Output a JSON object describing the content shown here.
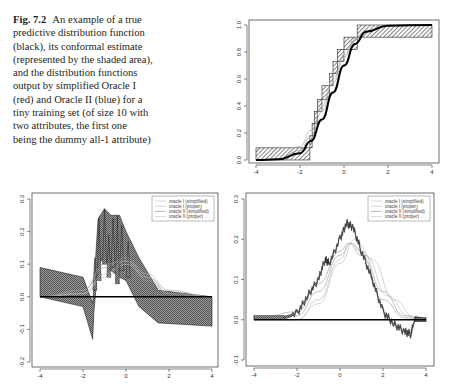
{
  "caption": {
    "label": "Fig. 7.2",
    "text": "An example of a true predictive distribution function (black), its conformal estimate (represented by the shaded area), and the distribution functions output by simplified Oracle I (red) and Oracle II (blue) for a tiny training set (of size 10 with two attributes, the first one being the dummy all-1 attribute)"
  },
  "colors": {
    "true_function": "#000000",
    "shading": "#555555",
    "oracle_curves": "#aaaaaa",
    "frame": "#333333"
  },
  "chart_data": [
    {
      "id": "top-right",
      "type": "line",
      "title": "",
      "xlabel": "",
      "ylabel": "",
      "xlim": [
        -4,
        4
      ],
      "ylim": [
        0,
        1
      ],
      "xticks": [
        "-4",
        "-2",
        "0",
        "2",
        "4"
      ],
      "yticks": [
        "0.0",
        "0.2",
        "0.4",
        "0.6",
        "0.8",
        "1.0"
      ],
      "grid": false,
      "series": [
        {
          "name": "true predictive distribution (black)",
          "x": [
            -4,
            -3,
            -2,
            -1.5,
            -1,
            -0.5,
            0,
            0.5,
            1,
            2,
            4
          ],
          "values": [
            0.0,
            0.005,
            0.05,
            0.14,
            0.3,
            0.5,
            0.7,
            0.86,
            0.95,
            0.995,
            1.0
          ]
        },
        {
          "name": "conformal estimate (shaded steps)",
          "x": [
            -4,
            -1.55,
            -1.45,
            -1.35,
            -1.2,
            -1.0,
            -0.65,
            -0.5,
            -0.3,
            0.0,
            0.6,
            4
          ],
          "lower": [
            0,
            0.09,
            0.18,
            0.27,
            0.36,
            0.45,
            0.55,
            0.64,
            0.73,
            0.82,
            0.91,
            0.91
          ],
          "upper": [
            0.09,
            0.18,
            0.27,
            0.36,
            0.45,
            0.55,
            0.64,
            0.73,
            0.82,
            0.91,
            1.0,
            1.0
          ]
        },
        {
          "name": "oracle I (simplified)"
        },
        {
          "name": "oracle II (simplified)"
        }
      ]
    },
    {
      "id": "bottom-left",
      "type": "line",
      "title": "",
      "xlim": [
        -4,
        4
      ],
      "ylim": [
        -0.2,
        0.3
      ],
      "xticks": [
        "-4",
        "-2",
        "0",
        "2",
        "4"
      ],
      "yticks": [
        "-0.2",
        "-0.1",
        "0.0",
        "0.1",
        "0.2",
        "0.3"
      ],
      "grid": false,
      "legend": {
        "position": "topright",
        "entries": [
          "oracle I (simplified)",
          "oracle I (proper)",
          "oracle II (simplified)",
          "oracle II (proper)"
        ]
      },
      "series": [
        {
          "name": "zero reference line",
          "x": [
            -4,
            4
          ],
          "values": [
            0,
            0
          ]
        },
        {
          "name": "conformal difference band (shaded)",
          "x": [
            -4,
            -2,
            -1.55,
            -1.5,
            -1.3,
            -1.0,
            -0.7,
            -0.3,
            0,
            0.6,
            1.5,
            4
          ],
          "upper": [
            0.09,
            0.06,
            -0.02,
            0.03,
            0.24,
            0.27,
            0.25,
            0.25,
            0.2,
            0.12,
            0.02,
            0.0
          ],
          "lower": [
            0.0,
            -0.03,
            -0.13,
            -0.05,
            0.1,
            0.12,
            0.08,
            0.06,
            0.05,
            -0.03,
            -0.08,
            -0.09
          ]
        },
        {
          "name": "oracle I (simplified)",
          "x": [
            -4,
            -2,
            -1,
            0,
            1,
            2,
            4
          ],
          "values": [
            0,
            0.02,
            0.09,
            0.12,
            0.06,
            0.01,
            0
          ]
        },
        {
          "name": "oracle I (proper)",
          "x": [
            -4,
            -2,
            -1,
            0,
            1,
            2,
            4
          ],
          "values": [
            0,
            0.01,
            0.07,
            0.11,
            0.07,
            0.02,
            0
          ]
        },
        {
          "name": "oracle II (simplified)",
          "x": [
            -4,
            -2,
            -1,
            0,
            1,
            2,
            4
          ],
          "values": [
            0,
            0.02,
            0.1,
            0.11,
            0.05,
            0.01,
            0
          ]
        },
        {
          "name": "oracle II (proper)",
          "x": [
            -4,
            -2,
            -1,
            0,
            1,
            2,
            4
          ],
          "values": [
            0,
            0.01,
            0.06,
            0.1,
            0.06,
            0.02,
            0
          ]
        }
      ]
    },
    {
      "id": "bottom-right",
      "type": "line",
      "title": "",
      "xlim": [
        -4,
        4
      ],
      "ylim": [
        -0.1,
        0.3
      ],
      "xticks": [
        "-4",
        "-2",
        "0",
        "2",
        "4"
      ],
      "yticks": [
        "-0.1",
        "0.0",
        "0.1",
        "0.2",
        "0.3"
      ],
      "grid": false,
      "legend": {
        "position": "topright",
        "entries": [
          "oracle I (simplified)",
          "oracle I (proper)",
          "oracle II (simplified)",
          "oracle II (proper)"
        ]
      },
      "series": [
        {
          "name": "zero reference line",
          "x": [
            -4,
            4
          ],
          "values": [
            0,
            0
          ]
        },
        {
          "name": "conformal difference (shaded jagged)",
          "x": [
            -4,
            -2.6,
            -2.0,
            -1.5,
            -1.0,
            -0.7,
            -0.5,
            0.0,
            0.3,
            0.6,
            1.0,
            1.5,
            2.0,
            2.5,
            3.0,
            3.3,
            3.5,
            4.0
          ],
          "values": [
            0.005,
            0.005,
            0.015,
            0.06,
            0.1,
            0.15,
            0.14,
            0.2,
            0.24,
            0.23,
            0.17,
            0.1,
            0.02,
            -0.01,
            -0.03,
            -0.035,
            0.005,
            0.0
          ]
        },
        {
          "name": "oracle I (simplified)",
          "x": [
            -4,
            -2,
            -1,
            0,
            0.5,
            1,
            2,
            3,
            4
          ],
          "values": [
            0,
            0.01,
            0.07,
            0.16,
            0.19,
            0.17,
            0.07,
            0.01,
            0
          ]
        },
        {
          "name": "oracle I (proper)",
          "x": [
            -4,
            -2,
            -1,
            0,
            0.7,
            1.5,
            2.5,
            3.5,
            4
          ],
          "values": [
            0,
            0.0,
            0.04,
            0.14,
            0.2,
            0.15,
            0.05,
            0.005,
            0
          ]
        },
        {
          "name": "oracle II (simplified)",
          "x": [
            -4,
            -2,
            -1,
            0,
            0.4,
            1,
            2,
            3,
            4
          ],
          "values": [
            0,
            0.02,
            0.09,
            0.17,
            0.19,
            0.16,
            0.05,
            0.005,
            0
          ]
        },
        {
          "name": "oracle II (proper)",
          "x": [
            -4,
            -2,
            -1,
            0,
            0.5,
            1.2,
            2.2,
            3.2,
            4
          ],
          "values": [
            0,
            0.0,
            0.05,
            0.15,
            0.19,
            0.16,
            0.06,
            0.01,
            0
          ]
        }
      ]
    }
  ]
}
